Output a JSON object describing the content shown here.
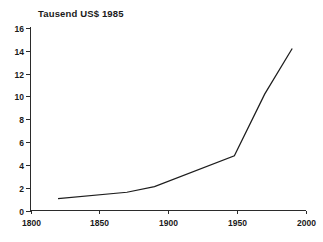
{
  "chart_data": {
    "type": "line",
    "title": "Tausend US$ 1985",
    "subtitle": "",
    "xlabel": "",
    "ylabel": "",
    "xlim": [
      1800,
      2000
    ],
    "ylim": [
      0,
      16
    ],
    "grid": false,
    "legend": false,
    "legend_position": "none",
    "xticks": [
      1800,
      1850,
      1900,
      1950,
      2000
    ],
    "xtick_labels": [
      "1800",
      "1850",
      "1900",
      "1950",
      "2000"
    ],
    "yticks": [
      0,
      2,
      4,
      6,
      8,
      10,
      12,
      14,
      16
    ],
    "ytick_labels": [
      "0",
      "2",
      "4",
      "6",
      "8",
      "10",
      "12",
      "14",
      "16"
    ],
    "series": [
      {
        "name": "Tausend US$ 1985",
        "color": "#1d1d1d",
        "x": [
          1820,
          1870,
          1890,
          1948,
          1970,
          1990
        ],
        "values": [
          1.05,
          1.6,
          2.1,
          4.8,
          10.2,
          14.2
        ]
      }
    ]
  },
  "axes": {
    "y_axis_name": "y-axis",
    "x_axis_name": "x-axis"
  }
}
